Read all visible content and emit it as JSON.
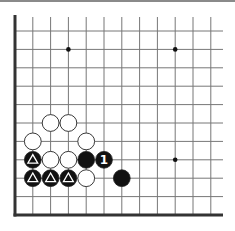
{
  "board": {
    "description": "Go board corner diagram (lower-left corner)",
    "columns_visible": 12,
    "rows_visible": 11,
    "edges": [
      "left",
      "bottom"
    ],
    "star_points": [
      {
        "col": 3,
        "row": 1
      },
      {
        "col": 9,
        "row": 1
      },
      {
        "col": 9,
        "row": 7
      }
    ],
    "stones": [
      {
        "color": "white",
        "col": 2,
        "row": 5,
        "mark": ""
      },
      {
        "color": "white",
        "col": 3,
        "row": 5,
        "mark": ""
      },
      {
        "color": "white",
        "col": 1,
        "row": 6,
        "mark": ""
      },
      {
        "color": "white",
        "col": 4,
        "row": 6,
        "mark": ""
      },
      {
        "color": "black",
        "col": 1,
        "row": 7,
        "mark": "triangle"
      },
      {
        "color": "white",
        "col": 2,
        "row": 7,
        "mark": ""
      },
      {
        "color": "white",
        "col": 3,
        "row": 7,
        "mark": ""
      },
      {
        "color": "black",
        "col": 4,
        "row": 7,
        "mark": ""
      },
      {
        "color": "black",
        "col": 5,
        "row": 7,
        "mark": "1"
      },
      {
        "color": "black",
        "col": 1,
        "row": 8,
        "mark": "triangle"
      },
      {
        "color": "black",
        "col": 2,
        "row": 8,
        "mark": "triangle"
      },
      {
        "color": "black",
        "col": 3,
        "row": 8,
        "mark": "triangle"
      },
      {
        "color": "white",
        "col": 4,
        "row": 8,
        "mark": ""
      },
      {
        "color": "black",
        "col": 6,
        "row": 8,
        "mark": ""
      }
    ],
    "colors": {
      "line": "#777777",
      "edge": "#333333",
      "black_stone": "#111111",
      "white_stone": "#ffffff",
      "stone_outline": "#222222"
    }
  }
}
